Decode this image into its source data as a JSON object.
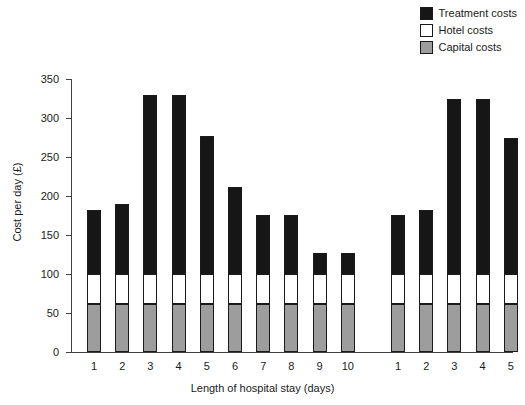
{
  "chart_data": {
    "type": "bar",
    "subtype": "stacked-bar",
    "title": "",
    "xlabel": "Length of hospital stay (days)",
    "ylabel": "Cost per day (£)",
    "ylim": [
      0,
      350
    ],
    "yticks": [
      0,
      50,
      100,
      150,
      200,
      250,
      300,
      350
    ],
    "ytick_labels": [
      "0",
      "50",
      "100",
      "150",
      "200",
      "250",
      "300",
      "350"
    ],
    "grid": false,
    "legend_position": "top-right",
    "categories": [
      "1",
      "2",
      "3",
      "4",
      "5",
      "6",
      "7",
      "8",
      "9",
      "10",
      "1",
      "2",
      "3",
      "4",
      "5"
    ],
    "groups": [
      {
        "name": "group-1",
        "categories": [
          "1",
          "2",
          "3",
          "4",
          "5",
          "6",
          "7",
          "8",
          "9",
          "10"
        ]
      },
      {
        "name": "group-2",
        "categories": [
          "1",
          "2",
          "3",
          "4",
          "5"
        ]
      }
    ],
    "series": [
      {
        "name": "Capital costs",
        "color": "#9d9d9d",
        "values": [
          62,
          62,
          62,
          62,
          62,
          62,
          62,
          62,
          62,
          62,
          62,
          62,
          62,
          62,
          62
        ]
      },
      {
        "name": "Hotel costs",
        "color": "#ffffff",
        "values": [
          38,
          38,
          38,
          38,
          38,
          38,
          38,
          38,
          38,
          38,
          38,
          38,
          38,
          38,
          38
        ]
      },
      {
        "name": "Treatment costs",
        "color": "#161616",
        "values": [
          82,
          90,
          230,
          229,
          177,
          112,
          76,
          76,
          27,
          27,
          76,
          82,
          225,
          225,
          175
        ]
      }
    ],
    "totals": [
      182,
      190,
      330,
      329,
      277,
      212,
      176,
      176,
      127,
      127,
      176,
      182,
      325,
      325,
      275
    ]
  },
  "legend": {
    "items": [
      {
        "label": "Treatment costs",
        "color": "#161616",
        "swatch": "treatment-swatch"
      },
      {
        "label": "Hotel costs",
        "color": "#ffffff",
        "swatch": "hotel-swatch"
      },
      {
        "label": "Capital costs",
        "color": "#9d9d9d",
        "swatch": "capital-swatch"
      }
    ]
  },
  "axes": {
    "y_label": "Cost per day (£)",
    "x_label": "Length of hospital stay (days)",
    "y_ticks": [
      "350",
      "300",
      "250",
      "200",
      "150",
      "100",
      "50",
      "0"
    ],
    "x_ticks": [
      "1",
      "2",
      "3",
      "4",
      "5",
      "6",
      "7",
      "8",
      "9",
      "10",
      "1",
      "2",
      "3",
      "4",
      "5"
    ]
  }
}
